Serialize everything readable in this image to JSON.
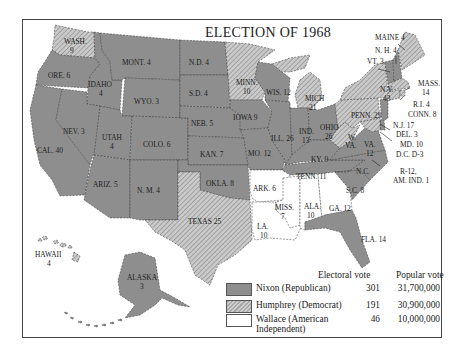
{
  "title": "ELECTION OF 1968",
  "colors": {
    "nixon": "#8e8e8e",
    "humphrey_hatch": "#b8b8b8",
    "wallace": "#ffffff",
    "border": "#444444"
  },
  "legend": {
    "electoral_header": "Electoral vote",
    "popular_header": "Popular vote",
    "entries": [
      {
        "name": "Nixon (Republican)",
        "electoral": "301",
        "popular": "31,700,000",
        "pattern": "solid-gray"
      },
      {
        "name": "Humphrey (Democrat)",
        "electoral": "191",
        "popular": "30,900,000",
        "pattern": "hatched-gray"
      },
      {
        "name_line1": "Wallace (American",
        "name_line2": "Independent)",
        "electoral": "46",
        "popular": "10,000,000",
        "pattern": "white"
      }
    ]
  },
  "states": {
    "wash": {
      "name": "WASH.",
      "votes": "9",
      "winner": "Humphrey"
    },
    "ore": {
      "name": "ORE.",
      "votes": "6",
      "winner": "Nixon"
    },
    "cal": {
      "name": "CAL.",
      "votes": "40",
      "winner": "Nixon"
    },
    "idaho": {
      "name": "IDAHO",
      "votes": "4",
      "winner": "Nixon"
    },
    "nev": {
      "name": "NEV.",
      "votes": "3",
      "winner": "Nixon"
    },
    "mont": {
      "name": "MONT.",
      "votes": "4",
      "winner": "Nixon"
    },
    "wyo": {
      "name": "WYO.",
      "votes": "3",
      "winner": "Nixon"
    },
    "utah": {
      "name": "UTAH",
      "votes": "4",
      "winner": "Nixon"
    },
    "colo": {
      "name": "COLO.",
      "votes": "6",
      "winner": "Nixon"
    },
    "ariz": {
      "name": "ARIZ.",
      "votes": "5",
      "winner": "Nixon"
    },
    "nm": {
      "name": "N. M.",
      "votes": "4",
      "winner": "Nixon"
    },
    "nd": {
      "name": "N.D.",
      "votes": "4",
      "winner": "Nixon"
    },
    "sd": {
      "name": "S.D.",
      "votes": "4",
      "winner": "Nixon"
    },
    "neb": {
      "name": "NEB.",
      "votes": "5",
      "winner": "Nixon"
    },
    "kan": {
      "name": "KAN.",
      "votes": "7",
      "winner": "Nixon"
    },
    "okla": {
      "name": "OKLA.",
      "votes": "8",
      "winner": "Nixon"
    },
    "texas": {
      "name": "TEXAS",
      "votes": "25",
      "winner": "Humphrey"
    },
    "minn": {
      "name": "MINN.",
      "votes": "10",
      "winner": "Humphrey"
    },
    "iowa": {
      "name": "IOWA",
      "votes": "9",
      "winner": "Nixon"
    },
    "mo": {
      "name": "MO.",
      "votes": "12",
      "winner": "Nixon"
    },
    "ark": {
      "name": "ARK.",
      "votes": "6",
      "winner": "Wallace"
    },
    "la": {
      "name": "LA.",
      "votes": "10",
      "winner": "Wallace"
    },
    "wis": {
      "name": "WIS.",
      "votes": "12",
      "winner": "Nixon"
    },
    "ill": {
      "name": "ILL.",
      "votes": "26",
      "winner": "Nixon"
    },
    "mich": {
      "name": "MICH",
      "votes": "21",
      "winner": "Humphrey"
    },
    "ind": {
      "name": "IND.",
      "votes": "13",
      "winner": "Nixon"
    },
    "ohio": {
      "name": "OHIO",
      "votes": "26",
      "winner": "Nixon"
    },
    "ky": {
      "name": "KY.",
      "votes": "9",
      "winner": "Nixon"
    },
    "tenn": {
      "name": "TENN.",
      "votes": "11",
      "winner": "Nixon"
    },
    "miss": {
      "name": "MISS.",
      "votes": "7",
      "winner": "Wallace"
    },
    "ala": {
      "name": "ALA.",
      "votes": "10",
      "winner": "Wallace"
    },
    "ga": {
      "name": "GA.",
      "votes": "12",
      "winner": "Wallace"
    },
    "fla": {
      "name": "FLA.",
      "votes": "14",
      "winner": "Nixon"
    },
    "sc": {
      "name": "S.C.",
      "votes": "8",
      "winner": "Nixon"
    },
    "nc": {
      "name": "N.C.",
      "votes": "",
      "winner": "Nixon"
    },
    "nc_note": {
      "line1": "R-12,",
      "line2": "AM. IND. 1"
    },
    "va": {
      "name": "VA.",
      "votes": "12",
      "winner": "Nixon"
    },
    "wva": {
      "name1": "W.",
      "name2": "VA.",
      "winner": "Humphrey"
    },
    "penn": {
      "name": "PENN.",
      "votes": "29",
      "winner": "Humphrey"
    },
    "ny": {
      "name": "N.Y.",
      "votes": "43",
      "winner": "Humphrey"
    },
    "nj": {
      "name": "N.J.",
      "votes": "17",
      "winner": "Nixon"
    },
    "del": {
      "name": "DEL.",
      "votes": "3",
      "winner": "Nixon"
    },
    "md": {
      "name": "MD.",
      "votes": "10",
      "winner": "Humphrey"
    },
    "dc": {
      "name": "D.C.",
      "votes": "D-3",
      "winner": "Humphrey"
    },
    "maine": {
      "name": "MAINE",
      "votes": "4",
      "winner": "Humphrey"
    },
    "nh": {
      "name": "N. H.",
      "votes": "4",
      "winner": "Nixon"
    },
    "vt": {
      "name": "VT.",
      "votes": "3",
      "winner": "Nixon"
    },
    "mass": {
      "name": "MASS.",
      "votes": "14",
      "winner": "Humphrey"
    },
    "ri": {
      "name": "R.I.",
      "votes": "4",
      "winner": "Humphrey"
    },
    "conn": {
      "name": "CONN.",
      "votes": "8",
      "winner": "Humphrey"
    },
    "hawaii": {
      "name": "HAWAII",
      "votes": "4",
      "winner": "Humphrey"
    },
    "alaska": {
      "name": "ALASKA",
      "votes": "3",
      "winner": "Nixon"
    }
  }
}
